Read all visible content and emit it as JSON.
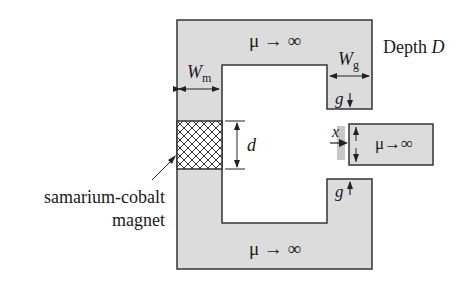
{
  "diagram": {
    "core": {
      "top_label": "μ → ∞",
      "bottom_label": "μ → ∞",
      "fill": "#dcdcdc",
      "stroke": "#333333"
    },
    "plunger": {
      "label": "μ→∞"
    },
    "dimensions": {
      "wm_main": "W",
      "wm_sub": "m",
      "wg_main": "W",
      "wg_sub": "g",
      "d": "d",
      "x": "x",
      "g_top": "g",
      "g_bottom": "g"
    },
    "depth_label": {
      "prefix": "Depth ",
      "var": "D"
    },
    "magnet_label": {
      "line1": "samarium-cobalt",
      "line2": "magnet"
    }
  }
}
